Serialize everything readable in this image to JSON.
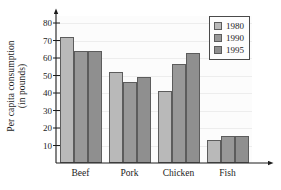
{
  "chart_data": {
    "type": "bar",
    "title": "",
    "xlabel": "",
    "ylabel": "Per capita consumption (in pounds)",
    "ylabel_line1": "Per capita consumption",
    "ylabel_line2": "(in pounds)",
    "categories": [
      "Beef",
      "Pork",
      "Chicken",
      "Fish"
    ],
    "series": [
      {
        "name": "1980",
        "color": "#b9b9b9",
        "values": [
          72,
          52,
          41,
          13
        ]
      },
      {
        "name": "1990",
        "color": "#989898",
        "values": [
          64,
          46.5,
          56.5,
          15.5
        ]
      },
      {
        "name": "1995",
        "color": "#8f8f8f",
        "values": [
          64,
          49,
          63,
          15.5
        ]
      }
    ],
    "ylim": [
      0,
      84
    ],
    "yticks": [
      10,
      20,
      30,
      40,
      50,
      60,
      70,
      80
    ],
    "ytick_labels": [
      "10",
      "20",
      "30",
      "40",
      "50",
      "60",
      "70",
      "80"
    ],
    "grid": true,
    "grid_axis": "y",
    "legend_position": "top-right",
    "legend_entries": [
      "1980",
      "1990",
      "1995"
    ],
    "axis_arrows": true
  }
}
